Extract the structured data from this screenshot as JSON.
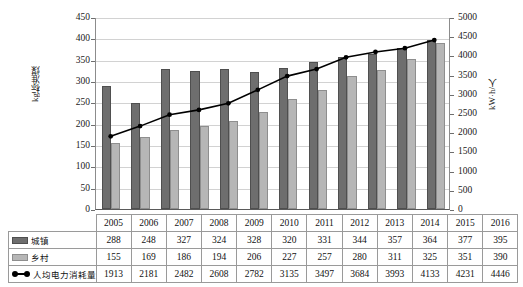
{
  "chart_data": {
    "type": "bar",
    "title": "",
    "subtitle": "",
    "xlabel": "",
    "ylabel": "kg标准煤",
    "ylabel_secondary": "kW·h/人",
    "categories": [
      "2005",
      "2006",
      "2007",
      "2008",
      "2009",
      "2010",
      "2011",
      "2012",
      "2013",
      "2014",
      "2015",
      "2016"
    ],
    "ylim": [
      0,
      450
    ],
    "ylim_secondary": [
      0,
      5000
    ],
    "yticks": [
      0,
      50,
      100,
      150,
      200,
      250,
      300,
      350,
      400,
      450
    ],
    "yticks_secondary": [
      0,
      500,
      1000,
      1500,
      2000,
      2500,
      3000,
      3500,
      4000,
      4500,
      5000
    ],
    "grid": true,
    "legend_position": "table-left-column",
    "series": [
      {
        "name": "城镇",
        "kind": "bar",
        "axis": "primary",
        "color": "#6e6e6e",
        "values": [
          288,
          248,
          327,
          324,
          328,
          320,
          331,
          344,
          357,
          364,
          377,
          395
        ]
      },
      {
        "name": "乡村",
        "kind": "bar",
        "axis": "primary",
        "color": "#b6b6b6",
        "values": [
          155,
          169,
          186,
          194,
          206,
          227,
          257,
          280,
          311,
          325,
          351,
          390
        ]
      },
      {
        "name": "人均电力消耗量",
        "kind": "line",
        "axis": "secondary",
        "color": "#000000",
        "values": [
          1913,
          2181,
          2482,
          2608,
          2782,
          3135,
          3497,
          3684,
          3993,
          4133,
          4231,
          4446
        ]
      }
    ]
  },
  "table": {
    "corner_label": "",
    "columns": [
      "2005",
      "2006",
      "2007",
      "2008",
      "2009",
      "2010",
      "2011",
      "2012",
      "2013",
      "2014",
      "2015",
      "2016"
    ],
    "rows": [
      {
        "label": "城镇",
        "marker": "swatch-urban",
        "values": [
          "288",
          "248",
          "327",
          "324",
          "328",
          "320",
          "331",
          "344",
          "357",
          "364",
          "377",
          "395"
        ]
      },
      {
        "label": "乡村",
        "marker": "swatch-rural",
        "values": [
          "155",
          "169",
          "186",
          "194",
          "206",
          "227",
          "257",
          "280",
          "311",
          "325",
          "351",
          "390"
        ]
      },
      {
        "label": "人均电力消耗量",
        "marker": "swatch-line",
        "values": [
          "1913",
          "2181",
          "2482",
          "2608",
          "2782",
          "3135",
          "3497",
          "3684",
          "3993",
          "4133",
          "4231",
          "4446"
        ]
      }
    ]
  },
  "colors": {
    "urban": "#6e6e6e",
    "rural": "#b6b6b6",
    "line": "#000000",
    "grid": "#d2d2d2",
    "axis": "#8c8c8c"
  }
}
